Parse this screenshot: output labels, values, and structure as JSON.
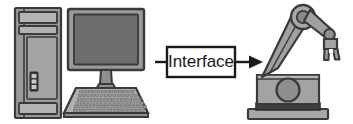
{
  "diagram": {
    "background_color": "#ffffff",
    "nodes": {
      "computer": {
        "name": "computer",
        "parts": {
          "tower": "desktop-tower",
          "monitor": "monitor",
          "keyboard": "keyboard"
        },
        "tower_bays": 2,
        "tower_buttons": 3,
        "keyboard_rows": 6,
        "keyboard_cols": 17
      },
      "interface": {
        "name": "interface-box",
        "label": "Interface",
        "box_fill": "#ffffff",
        "box_stroke": "#1a1a1a"
      },
      "robot": {
        "name": "robot-arm",
        "parts": {
          "base_plate": "base-plate",
          "body": "robot-body",
          "shoulder_circle": "shoulder-circle",
          "upper_arm": "upper-arm",
          "elbow": "elbow-joint",
          "forearm": "forearm",
          "wrist": "wrist-joint",
          "gripper": "gripper-claw"
        },
        "gripper_fingers": 2
      }
    },
    "connector": {
      "name": "interface-arrow",
      "from": "computer",
      "to": "robot",
      "direction": "right",
      "arrowhead": "solid-triangle",
      "stroke": "#1a1a1a"
    },
    "colors": {
      "outline": "#3a3a3a",
      "outline_dark": "#1a1a1a",
      "body_light": "#b3b3b3",
      "body_mid": "#9a9a9a",
      "body_gray": "#8f8f8f",
      "screen_dark": "#6e6e6e",
      "shadow": "#5e5e5e",
      "key_fill": "#a8a8a8",
      "white": "#ffffff"
    }
  }
}
